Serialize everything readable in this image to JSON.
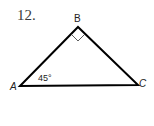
{
  "problem": {
    "number": "12."
  },
  "triangle": {
    "vertices": [
      {
        "label": "A",
        "x": 20,
        "y": 86
      },
      {
        "label": "B",
        "x": 78,
        "y": 27
      },
      {
        "label": "C",
        "x": 138,
        "y": 85
      }
    ],
    "right_angle_at": "B",
    "angle_label": "45°",
    "angle_at": "A",
    "stroke_color": "#000000"
  }
}
